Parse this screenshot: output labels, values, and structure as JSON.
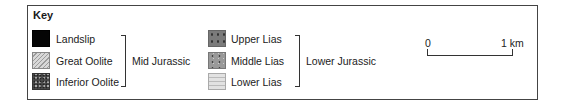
{
  "key": {
    "title": "Key",
    "groups": [
      {
        "name": "Mid Jurassic",
        "items": [
          {
            "label": "Landslip",
            "swatch": "solid-black",
            "color": "#050505"
          },
          {
            "label": "Great Oolite",
            "swatch": "diagonal-hatch",
            "color": "#d4d4d4"
          },
          {
            "label": "Inferior Oolite",
            "swatch": "dense-stipple",
            "color": "#4a4a4a"
          }
        ]
      },
      {
        "name": "Lower Jurassic",
        "items": [
          {
            "label": "Upper Lias",
            "swatch": "dark-grey-dots",
            "color": "#7b7b7b"
          },
          {
            "label": "Middle Lias",
            "swatch": "grey-dots",
            "color": "#999999"
          },
          {
            "label": "Lower Lias",
            "swatch": "light-grey-dashes",
            "color": "#e2e2e2"
          }
        ]
      }
    ]
  },
  "scale_bar": {
    "start_label": "0",
    "end_label": "1 km"
  }
}
